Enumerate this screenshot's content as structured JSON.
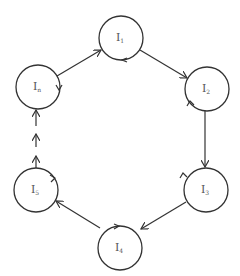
{
  "diagram": {
    "type": "cycle",
    "nodes": [
      {
        "id": "I1",
        "base": "I",
        "sub": "1",
        "cx": 121,
        "cy": 38
      },
      {
        "id": "I2",
        "base": "I",
        "sub": "2",
        "cx": 207,
        "cy": 89
      },
      {
        "id": "I3",
        "base": "I",
        "sub": "3",
        "cx": 206,
        "cy": 190
      },
      {
        "id": "I4",
        "base": "I",
        "sub": "4",
        "cx": 120,
        "cy": 248
      },
      {
        "id": "I5",
        "base": "I",
        "sub": "5",
        "cx": 36,
        "cy": 190
      },
      {
        "id": "In",
        "base": "I",
        "sub": "n",
        "cx": 38,
        "cy": 87
      }
    ],
    "edges": [
      {
        "from": "In",
        "to": "I1",
        "style": "solid"
      },
      {
        "from": "I1",
        "to": "I2",
        "style": "solid"
      },
      {
        "from": "I2",
        "to": "I3",
        "style": "solid"
      },
      {
        "from": "I3",
        "to": "I4",
        "style": "solid"
      },
      {
        "from": "I4",
        "to": "I5",
        "style": "solid"
      },
      {
        "from": "I5",
        "to": "In",
        "style": "dashed"
      }
    ],
    "labels": {
      "I1": {
        "base": "I",
        "sub": "1"
      },
      "I2": {
        "base": "I",
        "sub": "2"
      },
      "I3": {
        "base": "I",
        "sub": "3"
      },
      "I4": {
        "base": "I",
        "sub": "4"
      },
      "I5": {
        "base": "I",
        "sub": "5"
      },
      "In": {
        "base": "I",
        "sub": "n"
      }
    }
  }
}
